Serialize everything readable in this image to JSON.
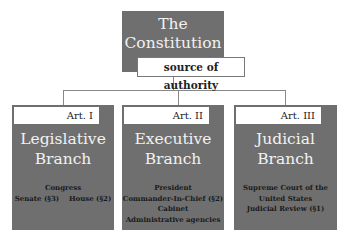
{
  "root": {
    "title_line1": "The",
    "title_line2": "Constitution",
    "subtitle": "source of authority"
  },
  "branches": [
    {
      "article": "Art. I",
      "title_line1": "Legislative",
      "title_line2": "Branch",
      "details": [
        "Congress",
        "Senate (§3)    House (§2)"
      ]
    },
    {
      "article": "Art. II",
      "title_line1": "Executive",
      "title_line2": "Branch",
      "details": [
        "President",
        "Commander-In-Chief (§2)",
        "Cabinet",
        "Administrative agencies"
      ]
    },
    {
      "article": "Art. III",
      "title_line1": "Judicial",
      "title_line2": "Branch",
      "details": [
        "Supreme Court of the",
        "United States",
        "Judicial Review (§1)"
      ]
    }
  ],
  "colors": {
    "box_fill": "#6f6f6f",
    "connector": "#888888"
  }
}
